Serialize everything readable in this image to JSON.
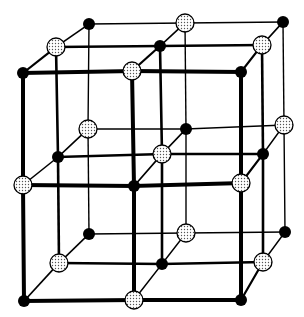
{
  "diagram": {
    "type": "crystal-lattice",
    "colors": {
      "background": "#ffffff",
      "line": "#000000",
      "filled_atom": "#000000",
      "dotted_atom_fill": "#ffffff",
      "dotted_atom_stipple": "#555555"
    },
    "atom_types": {
      "B": "filled-black-atom",
      "D": "dotted-white-atom"
    },
    "planes": [
      {
        "name": "front",
        "line_width": 4,
        "points": [
          [
            [
              23,
              73,
              "B"
            ],
            [
              132,
              71,
              "D"
            ],
            [
              241,
              72,
              "B"
            ]
          ],
          [
            [
              23,
              185,
              "D"
            ],
            [
              134,
              186,
              "B"
            ],
            [
              241,
              183,
              "D"
            ]
          ],
          [
            [
              24,
              301,
              "B"
            ],
            [
              134,
              300,
              "D"
            ],
            [
              241,
              300,
              "B"
            ]
          ]
        ]
      },
      {
        "name": "middle",
        "line_width": 2.6,
        "points": [
          [
            [
              56,
              47,
              "D"
            ],
            [
              160,
              46,
              "B"
            ],
            [
              262,
              45,
              "D"
            ]
          ],
          [
            [
              58,
              157,
              "B"
            ],
            [
              162,
              154,
              "D"
            ],
            [
              263,
              154,
              "B"
            ]
          ],
          [
            [
              59,
              263,
              "D"
            ],
            [
              162,
              264,
              "B"
            ],
            [
              263,
              262,
              "D"
            ]
          ]
        ]
      },
      {
        "name": "back",
        "line_width": 1.4,
        "points": [
          [
            [
              89,
              24,
              "B"
            ],
            [
              185,
              23,
              "D"
            ],
            [
              283,
              22,
              "B"
            ]
          ],
          [
            [
              88,
              129,
              "D"
            ],
            [
              186,
              129,
              "B"
            ],
            [
              284,
              125,
              "D"
            ]
          ],
          [
            [
              89,
              234,
              "B"
            ],
            [
              186,
              233,
              "D"
            ],
            [
              285,
              232,
              "B"
            ]
          ]
        ]
      }
    ],
    "depth_line_width": 1.6,
    "outer_depth_line_width": 2.2,
    "atom_radius": {
      "B": 6,
      "D": 9
    }
  }
}
